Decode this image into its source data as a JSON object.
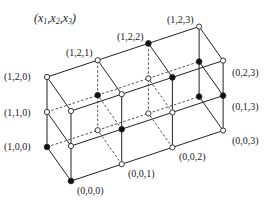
{
  "title": "(x1,x2,x3)",
  "title_parts": {
    "open": "(",
    "x1": "x",
    "s1": "1",
    "x2": "x",
    "s2": "2",
    "x3": "x",
    "s3": "3",
    "close": ")"
  },
  "geometry": {
    "origin": [
      71,
      181
    ],
    "step_x3": [
      50.7,
      -16.8
    ],
    "step_x2": [
      0,
      -35
    ],
    "step_x1": [
      -24,
      -34
    ]
  },
  "colors": {
    "line": "#222222",
    "filled": "#111111",
    "open": "#ffffff"
  },
  "nodes": [
    {
      "id": "0,0,0",
      "filled": true
    },
    {
      "id": "0,0,1",
      "filled": false
    },
    {
      "id": "0,0,2",
      "filled": false
    },
    {
      "id": "0,0,3",
      "filled": false
    },
    {
      "id": "0,1,0",
      "filled": false
    },
    {
      "id": "0,1,1",
      "filled": true
    },
    {
      "id": "0,1,2",
      "filled": false
    },
    {
      "id": "0,1,3",
      "filled": true
    },
    {
      "id": "0,2,0",
      "filled": false
    },
    {
      "id": "0,2,1",
      "filled": false
    },
    {
      "id": "0,2,2",
      "filled": true
    },
    {
      "id": "0,2,3",
      "filled": false
    },
    {
      "id": "1,0,0",
      "filled": true
    },
    {
      "id": "1,0,1",
      "filled": false
    },
    {
      "id": "1,0,2",
      "filled": false
    },
    {
      "id": "1,0,3",
      "filled": true
    },
    {
      "id": "1,1,0",
      "filled": false
    },
    {
      "id": "1,1,1",
      "filled": true
    },
    {
      "id": "1,1,2",
      "filled": false
    },
    {
      "id": "1,1,3",
      "filled": true
    },
    {
      "id": "1,2,0",
      "filled": false
    },
    {
      "id": "1,2,1",
      "filled": false
    },
    {
      "id": "1,2,2",
      "filled": true
    },
    {
      "id": "1,2,3",
      "filled": false
    }
  ],
  "labels": [
    {
      "text": "(1,2,0)",
      "node": "1,2,0",
      "x": 4,
      "y": 80
    },
    {
      "text": "(1,2,1)",
      "node": "1,2,1",
      "x": 66,
      "y": 56
    },
    {
      "text": "(1,2,2)",
      "node": "1,2,2",
      "x": 117,
      "y": 40
    },
    {
      "text": "(1,2,3)",
      "node": "1,2,3",
      "x": 167,
      "y": 23
    },
    {
      "text": "(1,1,0)",
      "node": "1,1,0",
      "x": 4,
      "y": 116
    },
    {
      "text": "(1,0,0)",
      "node": "1,0,0",
      "x": 4,
      "y": 150
    },
    {
      "text": "(0,2,3)",
      "node": "0,2,3",
      "x": 232,
      "y": 76
    },
    {
      "text": "(0,1,3)",
      "node": "0,1,3",
      "x": 232,
      "y": 110
    },
    {
      "text": "(0,0,3)",
      "node": "0,0,3",
      "x": 232,
      "y": 144
    },
    {
      "text": "(0,0,2)",
      "node": "0,0,2",
      "x": 179,
      "y": 160
    },
    {
      "text": "(0,0,1)",
      "node": "0,0,1",
      "x": 128,
      "y": 177
    },
    {
      "text": "(0,0,0)",
      "node": "0,0,0",
      "x": 77,
      "y": 194
    }
  ]
}
